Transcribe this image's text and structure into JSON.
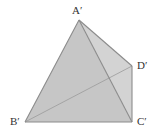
{
  "diagram": {
    "type": "tetrahedron",
    "colors": {
      "face_front": "#c6c6c6",
      "face_right": "#d3d3d3",
      "edge": "#8c8c8c",
      "hidden_edge": "#9a9a9a",
      "label": "#333333"
    },
    "vertices": {
      "A": {
        "label": "A′",
        "x": 79,
        "y": 20
      },
      "B": {
        "label": "B′",
        "x": 25,
        "y": 122
      },
      "C": {
        "label": "C′",
        "x": 132,
        "y": 122
      },
      "D": {
        "label": "D′",
        "x": 132,
        "y": 66
      }
    },
    "edges": [
      {
        "from": "A",
        "to": "B",
        "style": "solid"
      },
      {
        "from": "A",
        "to": "C",
        "style": "solid"
      },
      {
        "from": "A",
        "to": "D",
        "style": "solid"
      },
      {
        "from": "B",
        "to": "C",
        "style": "solid"
      },
      {
        "from": "C",
        "to": "D",
        "style": "solid"
      },
      {
        "from": "B",
        "to": "D",
        "style": "faint"
      }
    ]
  }
}
